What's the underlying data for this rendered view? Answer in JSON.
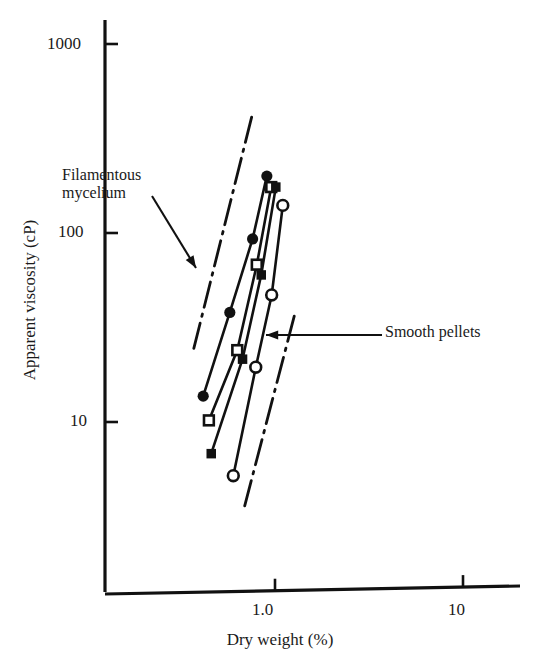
{
  "figure": {
    "kind": "log-log-scatter-line-plot"
  },
  "axes": {
    "y_label": "Apparent viscosity (cP)",
    "x_label": "Dry weight (%)",
    "y_ticks": [
      "10",
      "100",
      "1000"
    ],
    "x_ticks": [
      "1.0",
      "10"
    ]
  },
  "annotations": {
    "upper": "Filamentous\nmycelium",
    "upper_line1": "Filamentous",
    "upper_line2": "mycelium",
    "lower": "Smooth pellets"
  },
  "chart_data": {
    "type": "scatter",
    "title": "",
    "xlabel": "Dry weight (%)",
    "ylabel": "Apparent viscosity (cP)",
    "xscale": "log",
    "yscale": "log",
    "xlim": [
      0.28,
      22
    ],
    "ylim": [
      4,
      1400
    ],
    "xticks": [
      1.0,
      10
    ],
    "xticklabels": [
      "1.0",
      "10"
    ],
    "yticks": [
      10,
      100,
      1000
    ],
    "yticklabels": [
      "10",
      "100",
      "1000"
    ],
    "grid": false,
    "legend": null,
    "series": [
      {
        "name": "filled-circle",
        "marker": "filled-circle",
        "points": [
          {
            "x": 0.415,
            "y": 13.7
          },
          {
            "x": 0.575,
            "y": 38.0
          },
          {
            "x": 0.76,
            "y": 93.0
          },
          {
            "x": 0.905,
            "y": 200.0
          }
        ]
      },
      {
        "name": "open-square",
        "marker": "open-square",
        "points": [
          {
            "x": 0.445,
            "y": 10.2
          },
          {
            "x": 0.63,
            "y": 24.0
          },
          {
            "x": 0.8,
            "y": 68.0
          },
          {
            "x": 0.955,
            "y": 175.0
          }
        ]
      },
      {
        "name": "filled-square",
        "marker": "filled-square",
        "points": [
          {
            "x": 0.458,
            "y": 6.8
          },
          {
            "x": 0.672,
            "y": 21.5
          },
          {
            "x": 0.845,
            "y": 60.0
          },
          {
            "x": 1.01,
            "y": 175.0
          }
        ]
      },
      {
        "name": "open-circle",
        "marker": "open-circle",
        "points": [
          {
            "x": 0.6,
            "y": 5.2
          },
          {
            "x": 0.79,
            "y": 19.5
          },
          {
            "x": 0.96,
            "y": 47.0
          },
          {
            "x": 1.1,
            "y": 140.0
          }
        ]
      }
    ],
    "envelopes": [
      {
        "name": "Filamentous mycelium",
        "style": "dash-dot",
        "points": [
          {
            "x": 0.37,
            "y": 24.5
          },
          {
            "x": 0.76,
            "y": 430.0
          }
        ]
      },
      {
        "name": "Smooth pellets",
        "style": "dash-dot",
        "points": [
          {
            "x": 0.69,
            "y": 3.6
          },
          {
            "x": 1.29,
            "y": 39.0
          }
        ]
      }
    ]
  }
}
